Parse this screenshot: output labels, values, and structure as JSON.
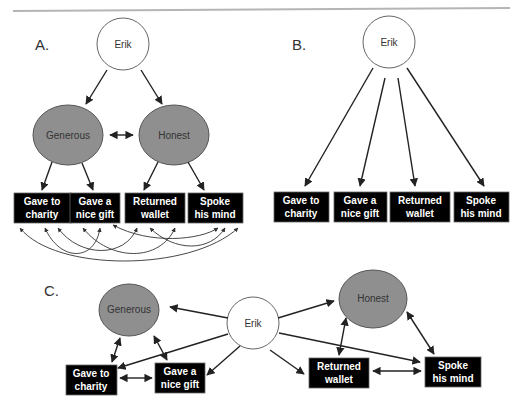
{
  "colors": {
    "latent_fill": "#8f8f8f",
    "root_fill": "#ffffff",
    "box_fill": "#000000",
    "box_text": "#ffffff",
    "rule": "#b5b5b5"
  },
  "panels": {
    "A": {
      "label": "A.",
      "root": "Erik",
      "latents": [
        "Generous",
        "Honest"
      ],
      "indicators": [
        {
          "line1": "Gave to",
          "line2": "charity"
        },
        {
          "line1": "Gave a",
          "line2": "nice gift"
        },
        {
          "line1": "Returned",
          "line2": "wallet"
        },
        {
          "line1": "Spoke",
          "line2": "his mind"
        }
      ]
    },
    "B": {
      "label": "B.",
      "root": "Erik",
      "indicators": [
        {
          "line1": "Gave to",
          "line2": "charity"
        },
        {
          "line1": "Gave a",
          "line2": "nice gift"
        },
        {
          "line1": "Returned",
          "line2": "wallet"
        },
        {
          "line1": "Spoke",
          "line2": "his mind"
        }
      ]
    },
    "C": {
      "label": "C.",
      "root": "Erik",
      "latents": [
        "Generous",
        "Honest"
      ],
      "indicators": [
        {
          "line1": "Gave to",
          "line2": "charity"
        },
        {
          "line1": "Gave a",
          "line2": "nice gift"
        },
        {
          "line1": "Returned",
          "line2": "wallet"
        },
        {
          "line1": "Spoke",
          "line2": "his mind"
        }
      ]
    }
  }
}
